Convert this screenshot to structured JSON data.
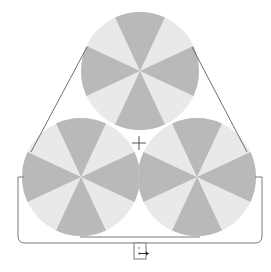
{
  "diagram": {
    "title": "",
    "colors": {
      "dark_wedge": "#b9b9b9",
      "light_wedge": "#e9e9e9",
      "line": "#6f6f6f",
      "background": "#ffffff"
    },
    "circles": [
      {
        "name": "top",
        "cx": 140,
        "cy": 71,
        "r": 59,
        "wedges": 8
      },
      {
        "name": "bottom-left",
        "cx": 81,
        "cy": 177,
        "r": 59,
        "wedges": 8
      },
      {
        "name": "bottom-right",
        "cx": 197,
        "cy": 177,
        "r": 59,
        "wedges": 8
      }
    ],
    "crosshair": {
      "x": 139,
      "y": 143,
      "size": 7
    },
    "connector_box": {
      "x": 134,
      "y": 243,
      "w": 12,
      "h": 16
    }
  }
}
